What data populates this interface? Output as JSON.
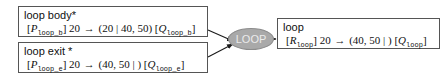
{
  "diagram": {
    "colors": {
      "node_border": "#555555",
      "node_background": "#ffffff",
      "ellipse_fill": "#a9a9a9",
      "ellipse_border": "#8c8c8c",
      "ellipse_text": "#ebebeb",
      "edge": "#1a1a1a",
      "text": "#101010"
    },
    "nodes": {
      "loop_body": {
        "title": "loop body",
        "star": "*",
        "formula": {
          "left_bracket": "[",
          "precondition": "P",
          "precondition_sub": "loop_b",
          "right_bracket": "]",
          "step": "20",
          "arrow": "→",
          "open_paren": "(",
          "before_bar": "20",
          "bar": "|",
          "after_bar": "40, 50",
          "close_paren": ")",
          "post_left_bracket": "[",
          "postcondition": "Q",
          "postcondition_sub": "loop_b",
          "post_right_bracket": "]"
        }
      },
      "loop_exit": {
        "title": "loop exit",
        "star": "*",
        "formula": {
          "left_bracket": "[",
          "precondition": "P",
          "precondition_sub": "loop_e",
          "right_bracket": "]",
          "step": "20",
          "arrow": "→",
          "open_paren": "(",
          "before_bar": "40, 50",
          "bar": "|",
          "after_bar": "",
          "close_paren": ")",
          "post_left_bracket": "[",
          "postcondition": "Q",
          "postcondition_sub": "loop_e",
          "post_right_bracket": "]"
        }
      },
      "loop": {
        "title": "loop",
        "star": "",
        "formula": {
          "left_bracket": "[",
          "precondition": "R",
          "precondition_sub": "loop",
          "right_bracket": "]",
          "step": "20",
          "arrow": "→",
          "open_paren": "(",
          "before_bar": "40, 50",
          "bar": "|",
          "after_bar": "",
          "close_paren": ")",
          "post_left_bracket": "[",
          "postcondition": "Q",
          "postcondition_sub": "loop",
          "post_right_bracket": "]"
        }
      },
      "loop_rule": {
        "label": "LOOP"
      }
    },
    "edges": [
      {
        "from": "loop_body",
        "to": "loop_rule"
      },
      {
        "from": "loop_exit",
        "to": "loop_rule"
      },
      {
        "from": "loop_rule",
        "to": "loop"
      }
    ]
  }
}
